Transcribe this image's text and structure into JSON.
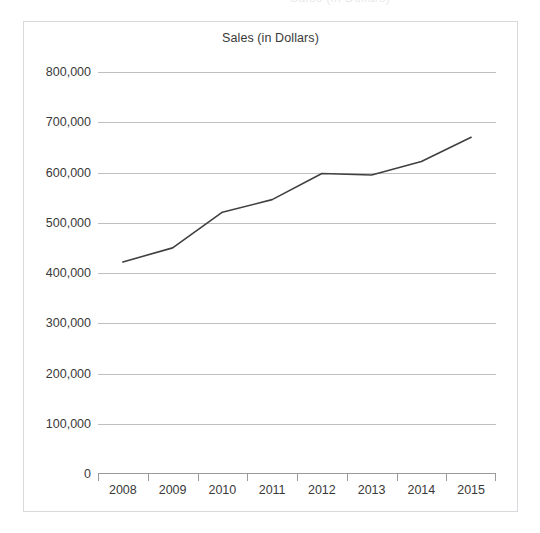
{
  "page": {
    "background_color": "#ffffff",
    "cropped_header_text": "Sales (in Dollars)"
  },
  "chart_frame": {
    "border_color": "#d9d9dd",
    "background_color": "#ffffff"
  },
  "chart_data": {
    "type": "line",
    "title": "Sales (in Dollars)",
    "xlabel": "",
    "ylabel": "",
    "categories": [
      "2008",
      "2009",
      "2010",
      "2011",
      "2012",
      "2013",
      "2014",
      "2015"
    ],
    "values": [
      422000,
      450000,
      521000,
      546000,
      598000,
      595000,
      622000,
      670000
    ],
    "series": [
      {
        "name": "Sales",
        "values": [
          422000,
          450000,
          521000,
          546000,
          598000,
          595000,
          622000,
          670000
        ],
        "color": "#404040",
        "line_width": 1.6,
        "markers": false
      }
    ],
    "ylim": [
      0,
      800000
    ],
    "ytick_values": [
      0,
      100000,
      200000,
      300000,
      400000,
      500000,
      600000,
      700000,
      800000
    ],
    "ytick_labels": [
      "0",
      "100,000",
      "200,000",
      "300,000",
      "400,000",
      "500,000",
      "600,000",
      "700,000",
      "800,000"
    ],
    "grid": true,
    "grid_color": "#bfbfbf",
    "grid_axis": "y",
    "axis_line_color": "#9a9a9a",
    "legend": false,
    "legend_position": "none",
    "tick_position": "category-boundaries",
    "text_color": "#3a3a3a"
  }
}
